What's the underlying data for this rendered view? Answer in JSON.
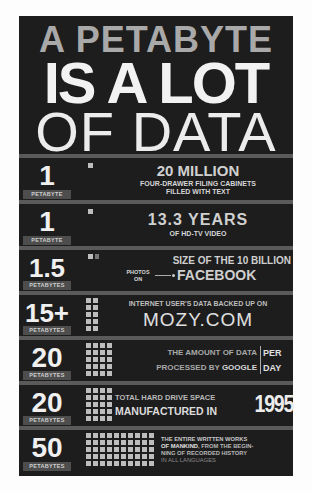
{
  "header": {
    "line1": "A PETABYTE",
    "line2": "IS A LOT",
    "line3": "OF DATA"
  },
  "rows": [
    {
      "number": "1",
      "unit": "PETABYTE",
      "squares": 1,
      "big": "20 MILLION",
      "small1": "FOUR-DRAWER FILING CABINETS",
      "small2": "FILLED WITH TEXT"
    },
    {
      "number": "1",
      "unit": "PETABYTE",
      "squares": 1,
      "big": "13.3 YEARS",
      "small1": "OF HD-TV VIDEO"
    },
    {
      "number": "1.5",
      "unit": "PETABYTES",
      "squares": 1.5,
      "line1": "SIZE OF THE 10 BILLION",
      "photos": "PHOTOS",
      "on": "ON",
      "big": "FACEBOOK"
    },
    {
      "number": "15+",
      "unit": "PETABYTES",
      "squares": 10,
      "small1": "INTERNET USER'S DATA BACKED UP ON",
      "big": "MOZY.COM"
    },
    {
      "number": "20",
      "unit": "PETABYTES",
      "squares": 20,
      "line1": "THE AMOUNT OF DATA",
      "line2a": "PROCESSED BY ",
      "line2b": "GOOGLE",
      "per": "PER",
      "day": "DAY"
    },
    {
      "number": "20",
      "unit": "PETABYTES",
      "squares": 20,
      "line1": "TOTAL HARD DRIVE SPACE",
      "line2": "MANUFACTURED IN",
      "year": "1995"
    },
    {
      "number": "50",
      "unit": "PETABYTES",
      "squares": 50,
      "line1": "THE ENTIRE WRITTEN WORKS",
      "line2a": "OF MANKIND",
      "line2b": ", FROM THE BEGIN-",
      "line3": "NING OF RECORDED HISTORY",
      "line4": "IN ALL LANGUAGES"
    }
  ],
  "colors": {
    "background": "#1d1d1d",
    "separator": "#5a5a5a",
    "text": "#d6d6d6",
    "title_gray": "#a9a9a9"
  }
}
